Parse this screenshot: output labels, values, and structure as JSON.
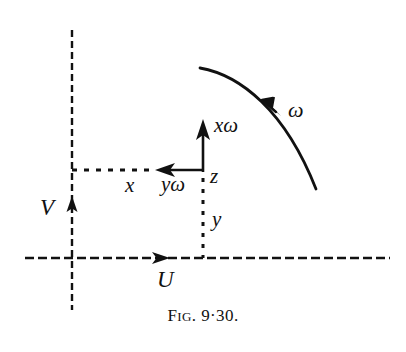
{
  "figure": {
    "caption_prefix": "F",
    "caption_smallcaps": "IG",
    "caption_rest": ". 9·30.",
    "caption_full": "FIG. 9·30.",
    "ink_color": "#111111",
    "background_color": "#ffffff"
  },
  "axes": {
    "vertical_label": "V",
    "horizontal_label": "U"
  },
  "vectors": {
    "x_label": "x",
    "y_omega_label": "yω",
    "x_omega_label": "xω",
    "z_label": "z",
    "y_label": "y",
    "omega_label": "ω"
  },
  "geometry": {
    "v_axis_x": 72,
    "v_axis_top": 30,
    "v_axis_bottom": 310,
    "v_arrow_tip_y": 198,
    "u_axis_y": 258,
    "u_axis_left": 25,
    "u_axis_right": 390,
    "u_arrow_tip_x": 168,
    "corner_x": 203,
    "corner_y": 172,
    "dashed_x_left": 72,
    "arrow_left_tip_x": 156,
    "x_omega_arrow_top_y": 120,
    "curve_start": [
      200,
      68
    ],
    "curve_end": [
      316,
      189
    ],
    "curve_arrow": [
      268,
      104
    ]
  }
}
